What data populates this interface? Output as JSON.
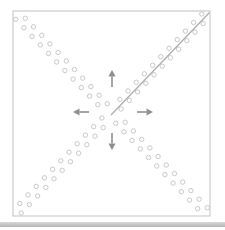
{
  "diagram": {
    "canvas": {
      "width": 225,
      "height": 230,
      "background": "#ffffff"
    },
    "sheet": {
      "x": 13,
      "y": 11,
      "width": 197,
      "height": 205,
      "stroke": "#c2c2c2",
      "stroke_width": 1,
      "fill": "#ffffff"
    },
    "center": {
      "x": 111.5,
      "y": 113.5
    },
    "fold_line": {
      "x1": 111,
      "y1": 115,
      "x2": 209.5,
      "y2": 12.5,
      "color": "#ababab",
      "width": 1.2
    },
    "perforations": {
      "radius": 2.2,
      "stroke": "#c9c9c9",
      "stroke_width": 1,
      "fill": "none",
      "per_arm_count": 22,
      "t_start": 0.055,
      "t_end": 0.93,
      "perp_offset": 3.8,
      "arms": [
        {
          "name": "top-left",
          "corner": {
            "x": 13,
            "y": 11
          }
        },
        {
          "name": "top-right",
          "corner": {
            "x": 210,
            "y": 11
          }
        },
        {
          "name": "bottom-left",
          "corner": {
            "x": 13,
            "y": 216
          }
        },
        {
          "name": "bottom-right",
          "corner": {
            "x": 210,
            "y": 216
          }
        }
      ]
    },
    "arrows": {
      "color": "#8f8f8f",
      "shaft_width": 1.6,
      "head_length": 6.5,
      "head_half_width": 3.6,
      "items": [
        {
          "name": "up",
          "tip": {
            "x": 112,
            "y": 70
          },
          "tail": {
            "x": 112,
            "y": 87
          }
        },
        {
          "name": "down",
          "tip": {
            "x": 112,
            "y": 150
          },
          "tail": {
            "x": 112,
            "y": 133
          }
        },
        {
          "name": "left",
          "tip": {
            "x": 73,
            "y": 112
          },
          "tail": {
            "x": 89,
            "y": 112
          }
        },
        {
          "name": "right",
          "tip": {
            "x": 153,
            "y": 112
          },
          "tail": {
            "x": 137,
            "y": 112
          }
        }
      ]
    },
    "bottom_band": {
      "x": 0,
      "y": 222,
      "width": 225,
      "height": 5,
      "color_top": "#d8d8d8",
      "color_bottom": "#b5b5b5"
    }
  }
}
